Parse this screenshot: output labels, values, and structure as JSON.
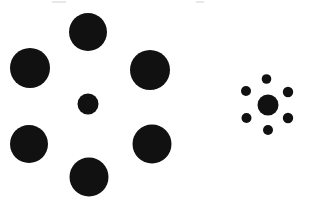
{
  "figure": {
    "canvas": {
      "width": 309,
      "height": 202
    },
    "background_color": "#ffffff",
    "ink_color": "#111111"
  },
  "chart_data": {
    "type": "scatter",
    "subtitle": "Two identical central target discs flanked by differently sized inducer discs",
    "xlabel": "",
    "ylabel": "",
    "xlim": [
      0,
      309
    ],
    "ylim": [
      0,
      202
    ],
    "grid": false,
    "legend": "none",
    "units": "pixels",
    "marker": "filled-circle",
    "marker_color": "#111111",
    "y_axis_direction": "down",
    "series": [
      {
        "name": "Left group - large inducers",
        "role": "inducer",
        "count": 6,
        "points": [
          {
            "label": "inducer-top-center",
            "x": 88,
            "y": 32,
            "r": 19.0,
            "diameter": 38.0
          },
          {
            "label": "inducer-left",
            "x": 30,
            "y": 68,
            "r": 20.0,
            "diameter": 40.0
          },
          {
            "label": "inducer-right",
            "x": 150,
            "y": 70,
            "r": 20.0,
            "diameter": 40.0
          },
          {
            "label": "inducer-bottom-left",
            "x": 29,
            "y": 144,
            "r": 19.0,
            "diameter": 38.0
          },
          {
            "label": "inducer-bottom-right",
            "x": 152,
            "y": 144,
            "r": 19.5,
            "diameter": 39.0
          },
          {
            "label": "inducer-bottom-center",
            "x": 89,
            "y": 177,
            "r": 19.5,
            "diameter": 39.0
          }
        ]
      },
      {
        "name": "Left group - central target",
        "role": "target",
        "count": 1,
        "points": [
          {
            "label": "target-left",
            "x": 88,
            "y": 104,
            "r": 10.5,
            "diameter": 21.0
          }
        ]
      },
      {
        "name": "Right group - small inducers",
        "role": "inducer",
        "count": 6,
        "points": [
          {
            "label": "inducer-n",
            "x": 266.5,
            "y": 79.0,
            "r": 4.8,
            "diameter": 9.6
          },
          {
            "label": "inducer-nw",
            "x": 246.0,
            "y": 91.0,
            "r": 5.0,
            "diameter": 10.0
          },
          {
            "label": "inducer-ne",
            "x": 288.0,
            "y": 92.0,
            "r": 5.2,
            "diameter": 10.4
          },
          {
            "label": "inducer-sw",
            "x": 246.5,
            "y": 118.0,
            "r": 5.0,
            "diameter": 10.0
          },
          {
            "label": "inducer-se",
            "x": 288.0,
            "y": 118.0,
            "r": 5.2,
            "diameter": 10.4
          },
          {
            "label": "inducer-s",
            "x": 268.0,
            "y": 130.0,
            "r": 5.0,
            "diameter": 10.0
          }
        ]
      },
      {
        "name": "Right group - central target",
        "role": "target",
        "count": 1,
        "points": [
          {
            "label": "target-right",
            "x": 268,
            "y": 105,
            "r": 10.5,
            "diameter": 21.0
          }
        ]
      }
    ],
    "annotations": [
      {
        "label": "identical-targets-note",
        "text": "Both central targets have identical diameter (21 px)"
      }
    ]
  },
  "artifacts": [
    {
      "label": "scan-speck-left",
      "x": 52,
      "y": 1,
      "width": 14,
      "height": 2,
      "color": "#e8e8e8"
    },
    {
      "label": "scan-speck-right",
      "x": 196,
      "y": 1,
      "width": 8,
      "height": 2,
      "color": "#e8e8e8"
    }
  ]
}
